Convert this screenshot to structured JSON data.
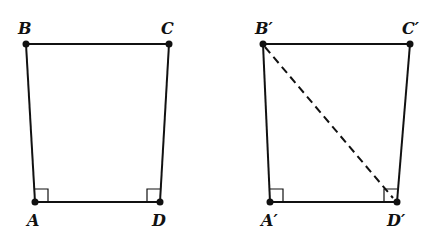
{
  "figures": [
    {
      "name": "quadrilateral-ABCD",
      "vertices": {
        "A": {
          "label": "A",
          "x": 35,
          "y": 202
        },
        "B": {
          "label": "B",
          "x": 26,
          "y": 44
        },
        "C": {
          "label": "C",
          "x": 169,
          "y": 44
        },
        "D": {
          "label": "D",
          "x": 160,
          "y": 202
        }
      },
      "right_angles": [
        "A",
        "D"
      ],
      "diagonals": []
    },
    {
      "name": "quadrilateral-A'B'C'D'",
      "vertices": {
        "A": {
          "label": "A′",
          "x": 270,
          "y": 202
        },
        "B": {
          "label": "B′",
          "x": 263,
          "y": 44
        },
        "C": {
          "label": "C′",
          "x": 410,
          "y": 44
        },
        "D": {
          "label": "D′",
          "x": 396,
          "y": 202
        }
      },
      "right_angles": [
        "A′",
        "D′"
      ],
      "diagonals": [
        {
          "from": "B′",
          "to": "D′",
          "style": "dashed"
        }
      ]
    }
  ],
  "colors": {
    "stroke": "#111111",
    "background": "#ffffff"
  }
}
